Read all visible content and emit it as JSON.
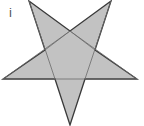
{
  "figure": {
    "label": "i",
    "shape": "five-pointed star (inverted, with internal pentagon lines)",
    "fill_color": "#c2c2c2",
    "stroke_color": "#3a3a3a",
    "vertices": [
      [
        29,
        1
      ],
      [
        111,
        1
      ],
      [
        137,
        79
      ],
      [
        3,
        79
      ],
      [
        70,
        125
      ]
    ]
  }
}
